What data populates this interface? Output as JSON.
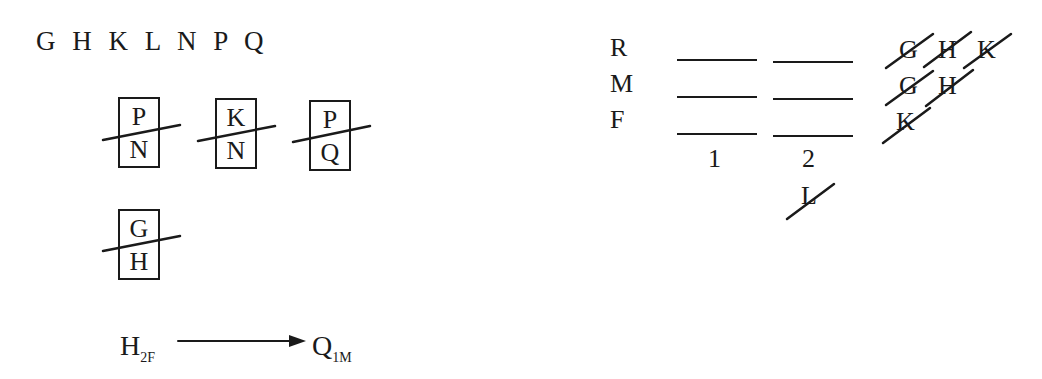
{
  "left_panel": {
    "letters": "G H K L N P Q",
    "boxes": [
      {
        "top": "P",
        "bottom": "N",
        "crossed_out": true
      },
      {
        "top": "K",
        "bottom": "N",
        "crossed_out": true
      },
      {
        "top": "P",
        "bottom": "Q",
        "crossed_out": true
      },
      {
        "top": "G",
        "bottom": "H",
        "crossed_out": true
      }
    ],
    "rule": {
      "from": "H",
      "from_sub": "2F",
      "to": "Q",
      "to_sub": "1M"
    }
  },
  "right_panel": {
    "rows": [
      {
        "label": "R",
        "crossed_candidates": [
          "G",
          "H",
          "K"
        ]
      },
      {
        "label": "M",
        "crossed_candidates": [
          "G",
          "H"
        ]
      },
      {
        "label": "F",
        "crossed_candidates": [
          "K"
        ]
      }
    ],
    "columns": [
      "1",
      "2"
    ],
    "below_col2_crossed": "L"
  }
}
